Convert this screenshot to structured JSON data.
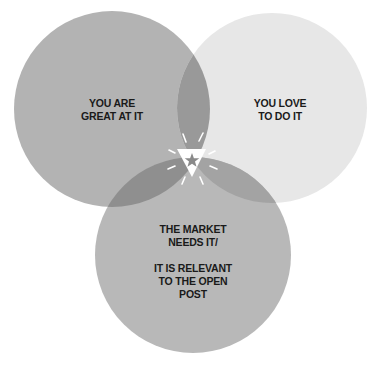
{
  "diagram": {
    "type": "venn",
    "circles": [
      {
        "id": "left",
        "cx": 112,
        "cy": 109,
        "r": 98,
        "color": "#b3b3b3",
        "label_lines": [
          "YOU ARE",
          "GREAT AT IT"
        ]
      },
      {
        "id": "right",
        "cx": 272,
        "cy": 108,
        "r": 95,
        "color": "#e7e7e7",
        "label_lines": [
          "YOU LOVE",
          "TO DO IT"
        ]
      },
      {
        "id": "bottom",
        "cx": 193,
        "cy": 255,
        "r": 98,
        "color": "#b8b8b8",
        "label_lines": [
          "THE MARKET",
          "NEEDS IT/",
          "",
          "IT IS RELEVANT",
          "TO THE OPEN",
          "POST"
        ]
      }
    ],
    "overlap_colors": {
      "left_right": "#999999",
      "left_bottom": "#8f8f8f",
      "right_bottom": "#a3a3a3",
      "center": "#ffffff"
    },
    "center_marker": {
      "shape": "inverted-triangle-with-star",
      "icon": "star-icon",
      "triangle_color": "#ffffff",
      "star_color": "#8a8a8a",
      "rays_color": "#ffffff"
    }
  },
  "labels": {
    "left": {
      "line1": "YOU ARE",
      "line2": "GREAT AT IT"
    },
    "right": {
      "line1": "YOU LOVE",
      "line2": "TO DO IT"
    },
    "bottom": {
      "line1": "THE MARKET",
      "line2": "NEEDS IT/",
      "line3": "IT IS RELEVANT",
      "line4": "TO THE OPEN",
      "line5": "POST"
    }
  }
}
